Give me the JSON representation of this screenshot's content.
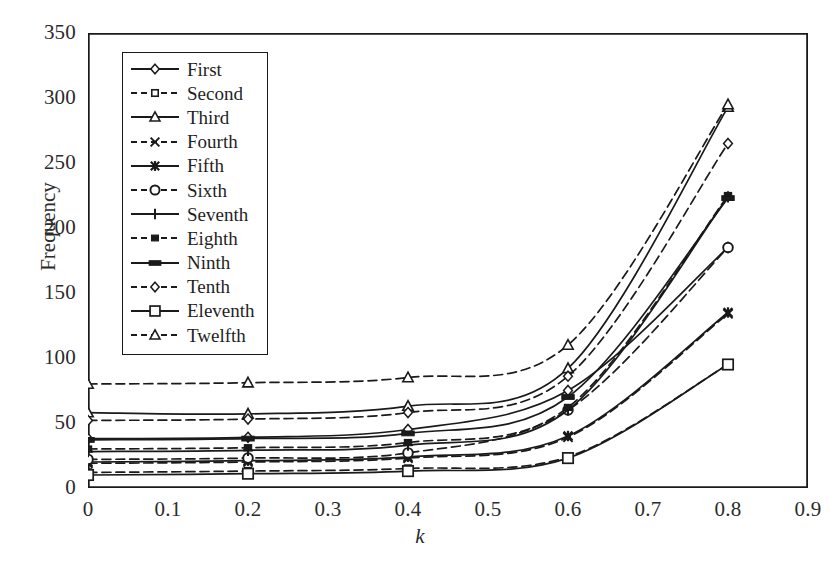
{
  "chart_data": {
    "type": "line",
    "title": "",
    "subtitle": "",
    "xlabel": "k",
    "ylabel": "Frequency",
    "xlim": [
      0,
      0.9
    ],
    "ylim": [
      0,
      350
    ],
    "x_ticks": [
      "0",
      "0.1",
      "0.2",
      "0.3",
      "0.4",
      "0.5",
      "0.6",
      "0.7",
      "0.8",
      "0.9"
    ],
    "x_tick_values": [
      0,
      0.1,
      0.2,
      0.3,
      0.4,
      0.5,
      0.6,
      0.7,
      0.8,
      0.9
    ],
    "y_ticks": [
      "0",
      "50",
      "100",
      "150",
      "200",
      "250",
      "300",
      "350"
    ],
    "y_tick_values": [
      0,
      50,
      100,
      150,
      200,
      250,
      300,
      350
    ],
    "grid": false,
    "legend_position": "upper-left-inside",
    "x": [
      0,
      0.2,
      0.4,
      0.6,
      0.8
    ],
    "series": [
      {
        "name": "First",
        "marker": "diamond-open",
        "line": "solid",
        "values": [
          38,
          39,
          45,
          75,
          185
        ]
      },
      {
        "name": "Second",
        "marker": "square-open",
        "line": "dashed",
        "values": [
          12,
          13,
          15,
          24,
          95
        ]
      },
      {
        "name": "Third",
        "marker": "triangle-open",
        "line": "solid",
        "values": [
          58,
          57,
          63,
          92,
          293
        ]
      },
      {
        "name": "Fourth",
        "marker": "x-cross",
        "line": "dashed",
        "values": [
          19,
          20,
          23,
          39,
          134
        ]
      },
      {
        "name": "Fifth",
        "marker": "star",
        "line": "solid",
        "values": [
          20,
          21,
          24,
          40,
          135
        ]
      },
      {
        "name": "Sixth",
        "marker": "circle-open",
        "line": "dashed",
        "values": [
          22,
          23,
          27,
          60,
          185
        ]
      },
      {
        "name": "Seventh",
        "marker": "plus",
        "line": "solid",
        "values": [
          28,
          29,
          33,
          60,
          224
        ]
      },
      {
        "name": "Eighth",
        "marker": "square-filled",
        "line": "dashed",
        "values": [
          30,
          31,
          35,
          62,
          225
        ]
      },
      {
        "name": "Ninth",
        "marker": "bar-filled",
        "line": "solid",
        "values": [
          37,
          38,
          42,
          70,
          223
        ]
      },
      {
        "name": "Tenth",
        "marker": "diamond-open",
        "line": "dashed",
        "values": [
          52,
          53,
          58,
          86,
          265
        ]
      },
      {
        "name": "Eleventh",
        "marker": "square-large",
        "line": "solid",
        "values": [
          10,
          11,
          13,
          23,
          95
        ]
      },
      {
        "name": "Twelfth",
        "marker": "triangle-open",
        "line": "dashed",
        "values": [
          80,
          81,
          85,
          110,
          295
        ]
      }
    ],
    "colors": {
      "line": "#1a1a1a",
      "axis": "#1a1a1a",
      "text": "#2b2b2b",
      "background": "#ffffff"
    }
  },
  "legend": {
    "items": [
      {
        "label": "First"
      },
      {
        "label": "Second"
      },
      {
        "label": "Third"
      },
      {
        "label": "Fourth"
      },
      {
        "label": "Fifth"
      },
      {
        "label": "Sixth"
      },
      {
        "label": "Seventh"
      },
      {
        "label": "Eighth"
      },
      {
        "label": "Ninth"
      },
      {
        "label": "Tenth"
      },
      {
        "label": "Eleventh"
      },
      {
        "label": "Twelfth"
      }
    ]
  }
}
